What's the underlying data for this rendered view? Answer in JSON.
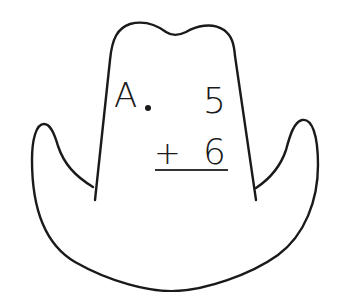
{
  "worksheet": {
    "problem_label": "A",
    "problem_label_punct": ".",
    "addend_top": "5",
    "operator": "+",
    "addend_bottom": "6",
    "answer": ""
  },
  "graphic": {
    "shape": "cowboy-hat-outline",
    "stroke_color": "#1a1a1a",
    "fill_color": "#ffffff"
  }
}
